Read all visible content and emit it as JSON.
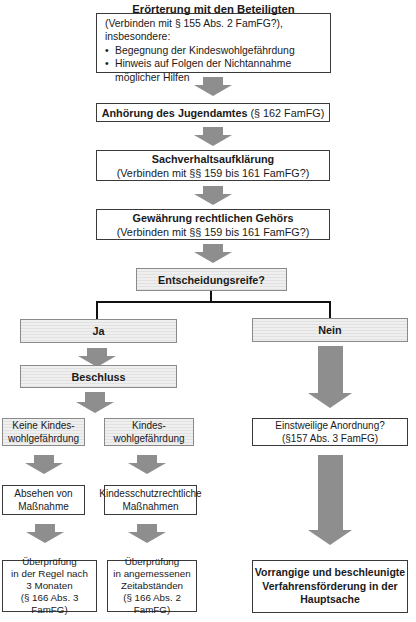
{
  "palette": {
    "arrow": "#8e8e8e",
    "shaded_fill": "#efefef",
    "shaded_stripe": "#e1e1e1",
    "shaded_border": "#8a8a8a",
    "box_border": "#3a3a3a",
    "connector": "#111111",
    "text": "#1a1a1a"
  },
  "bullet_glyph": "•",
  "nodes": {
    "eroerterung": {
      "title": "Erörterung mit den Beteiligten",
      "subtitle": "(Verbinden mit § 155 Abs. 2 FamFG?), insbesondere:",
      "bullets": [
        "Begegnung der Kindeswohlgefährdung",
        "Hinweis auf Folgen der Nichtannahme möglicher Hilfen"
      ]
    },
    "anhoerung": {
      "title_bold": "Anhörung des Jugendamtes",
      "title_rest": " (§ 162 FamFG)"
    },
    "sachverhalt": {
      "title": "Sachverhaltsaufklärung",
      "subtitle": "(Verbinden mit §§ 159 bis 161 FamFG?)"
    },
    "gehoer": {
      "title": "Gewährung rechtlichen Gehörs",
      "subtitle": "(Verbinden mit §§ 159 bis 161 FamFG?)"
    },
    "entscheidungsreife": {
      "label": "Entscheidungsreife?"
    },
    "ja": {
      "label": "Ja"
    },
    "nein": {
      "label": "Nein"
    },
    "beschluss": {
      "label": "Beschluss"
    },
    "keine_kwg": {
      "lines": [
        "Keine Kindes-",
        "wohlgefährdung"
      ]
    },
    "kwg": {
      "lines": [
        "Kindes-",
        "wohlgefährdung"
      ]
    },
    "einstweilige": {
      "lines": [
        "Einstweilige Anordnung?",
        "(§157 Abs. 3 FamFG)"
      ]
    },
    "absehen": {
      "lines": [
        "Absehen von",
        "Maßnahme"
      ]
    },
    "kindesschutz": {
      "lines": [
        "Kindesschutzrechtliche",
        "Maßnahmen"
      ]
    },
    "ueberpruefung_monate": {
      "lines": [
        "Überprüfung",
        "in der Regel nach",
        "3 Monaten",
        "(§ 166 Abs. 3 FamFG)"
      ]
    },
    "ueberpruefung_zeit": {
      "lines": [
        "Überprüfung",
        "in angemessenen",
        "Zeitabständen",
        "(§ 166 Abs. 2 FamFG)"
      ]
    },
    "vorrangige": {
      "lines": [
        "Vorrangige und beschleunigte",
        "Verfahrensförderung in der",
        "Hauptsache"
      ]
    }
  }
}
